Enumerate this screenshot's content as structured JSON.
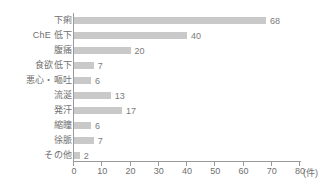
{
  "chart_data": {
    "type": "bar",
    "orientation": "horizontal",
    "title": "",
    "xlabel": "(件)",
    "ylabel": "",
    "xlim": [
      0,
      80
    ],
    "grid": false,
    "legend": null,
    "bar_color": "#c9c9c9",
    "axis_color": "#9a9a9a",
    "text_color": "#6f6f6f",
    "xticks": [
      0,
      10,
      20,
      30,
      40,
      50,
      60,
      70,
      80
    ],
    "xtick_labels": [
      "0",
      "10",
      "20",
      "30",
      "40",
      "50",
      "60",
      "70",
      "80"
    ],
    "unit_label": "(件)",
    "categories": [
      "下痢",
      "ChE 低下",
      "腹痛",
      "食欲低下",
      "悪心・嘔吐",
      "流涎",
      "発汗",
      "縮瞳",
      "徐脈",
      "その他"
    ],
    "values": [
      68,
      40,
      20,
      7,
      6,
      13,
      17,
      6,
      7,
      2
    ],
    "value_labels": [
      "68",
      "40",
      "20",
      "7",
      "6",
      "13",
      "17",
      "6",
      "7",
      "2"
    ]
  }
}
